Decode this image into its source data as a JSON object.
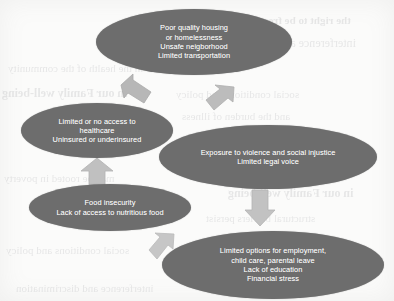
{
  "diagram": {
    "type": "concept-map",
    "node_fill_color": "#6d6d6d",
    "node_text_color": "#ffffff",
    "arrow_color": "#b9b9b9",
    "background_color": "#fbfbfa",
    "nodes": [
      {
        "id": "housing",
        "name": "housing-node",
        "lines": [
          "Poor quality housing",
          "or homelessness",
          "Unsafe neigborhood",
          "Limited transportation"
        ]
      },
      {
        "id": "healthcare",
        "name": "healthcare-node",
        "lines": [
          "Limited or no access to",
          "healthcare",
          "Uninsured or underinsured"
        ]
      },
      {
        "id": "violence",
        "name": "violence-node",
        "lines": [
          "Exposure to violence and social injustice",
          "Limited legal voice"
        ]
      },
      {
        "id": "food",
        "name": "food-insecurity-node",
        "lines": [
          "Food insecurity",
          "Lack of access to nutritious food"
        ]
      },
      {
        "id": "employment",
        "name": "employment-node",
        "lines": [
          "Limited options for employment,",
          "child care, parental leave",
          "Lack of education",
          "Financial stress"
        ]
      }
    ],
    "arrows": [
      {
        "id": "a1",
        "icon": "arrow-up-left-icon",
        "from": "healthcare",
        "to": "housing"
      },
      {
        "id": "a2",
        "icon": "arrow-up-right-icon",
        "from": "violence",
        "to": "housing"
      },
      {
        "id": "a3",
        "icon": "arrow-up-icon",
        "from": "food",
        "to": "healthcare"
      },
      {
        "id": "a4",
        "icon": "arrow-down-icon",
        "from": "violence",
        "to": "employment"
      },
      {
        "id": "a5",
        "icon": "arrow-up-right-icon",
        "from": "employment",
        "to": "food"
      }
    ]
  },
  "background_artifacts": {
    "note": "faint mirrored bleed-through text from reverse of scanned page",
    "lines": [
      "the right to be free from",
      "interference and discrimination",
      "in the health of the community",
      "in our Family well-being",
      "social conditions and policy",
      "and the burden of illness",
      "may be rooted in poverty",
      "structural barriers persist"
    ]
  }
}
